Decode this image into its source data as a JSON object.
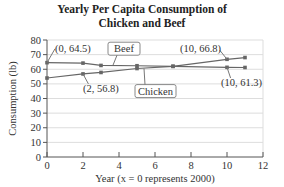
{
  "chart_data": {
    "type": "line",
    "title": "Yearly Per Capita Consumption of Chicken and Beef",
    "title_lines": [
      "Yearly Per Capita Consumption of",
      "Chicken and Beef"
    ],
    "xlabel": "Year (x = 0 represents 2000)",
    "ylabel": "Consumption (lb)",
    "xlim": [
      0,
      12
    ],
    "ylim": [
      0,
      80
    ],
    "x_ticks": [
      0,
      2,
      4,
      6,
      8,
      10,
      12
    ],
    "y_ticks": [
      0,
      10,
      20,
      30,
      40,
      50,
      60,
      70,
      80
    ],
    "grid": "horizontal",
    "series": [
      {
        "name": "Beef",
        "x": [
          0,
          2,
          3,
          5,
          7,
          10,
          11
        ],
        "values": [
          64.5,
          64.2,
          62.6,
          62.4,
          62.0,
          61.3,
          61.2
        ]
      },
      {
        "name": "Chicken",
        "x": [
          0,
          2,
          3,
          5,
          7,
          10,
          11
        ],
        "values": [
          54.0,
          56.8,
          57.8,
          60.5,
          62.0,
          66.8,
          68.0
        ]
      }
    ],
    "annotations": [
      "(0, 64.5)",
      "(2, 56.8)",
      "(10, 66.8)",
      "(10, 61.3)"
    ],
    "legend_labels": [
      "Beef",
      "Chicken"
    ]
  }
}
